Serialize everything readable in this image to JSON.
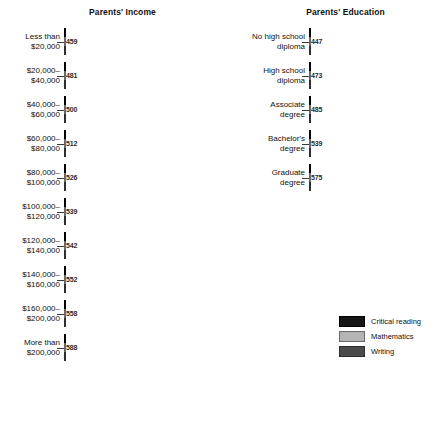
{
  "chart_data": {
    "type": "bar",
    "orientation": "horizontal",
    "grid": false,
    "legend_position": "bottom-right",
    "series_names": [
      "Critical reading",
      "Mathematics",
      "Writing"
    ],
    "series_colors": [
      "#151515",
      "#b4b4b4",
      "#4a4a4a"
    ],
    "panels": [
      {
        "key": "income",
        "title": "Parents' Income",
        "xlabel": "",
        "ylabel": "",
        "categories": [
          "Less than\n$20,000",
          "$20,000–\n$40,000",
          "$40,000–\n$60,000",
          "$60,000–\n$80,000",
          "$80,000–\n$100,000",
          "$100,000–\n$120,000",
          "$120,000–\n$140,000",
          "$140,000–\n$160,000",
          "$160,000–\n$200,000",
          "More than\n$200,000"
        ],
        "series": [
          {
            "name": "Critical reading",
            "values": [
              436,
              467,
              489,
              504,
              516,
              527,
              531,
              539,
              544,
              569
            ]
          },
          {
            "name": "Mathematics",
            "values": [
              459,
              481,
              500,
              512,
              526,
              539,
              542,
              552,
              558,
              588
            ]
          },
          {
            "name": "Writing",
            "values": [
              429,
              455,
              474,
              487,
              501,
              513,
              518,
              527,
              534,
              565
            ]
          }
        ]
      },
      {
        "key": "education",
        "title": "Parents' Education",
        "xlabel": "",
        "ylabel": "",
        "categories": [
          "No high school\ndiploma",
          "High school\ndiploma",
          "Associate\ndegree",
          "Bachelor's\ndegree",
          "Graduate\ndegree"
        ],
        "series": [
          {
            "name": "Critical reading",
            "values": [
              421,
              462,
              480,
              523,
              560
            ]
          },
          {
            "name": "Mathematics",
            "values": [
              447,
              473,
              485,
              539,
              575
            ]
          },
          {
            "name": "Writing",
            "values": [
              418,
              450,
              463,
              512,
              551
            ]
          }
        ]
      }
    ]
  },
  "legend": {
    "items": [
      {
        "label": "Critical reading",
        "color": "#151515",
        "key": "reading"
      },
      {
        "label": "Mathematics",
        "color": "#b4b4b4",
        "key": "math"
      },
      {
        "label": "Writing",
        "color": "#4a4a4a",
        "key": "writing"
      }
    ]
  }
}
